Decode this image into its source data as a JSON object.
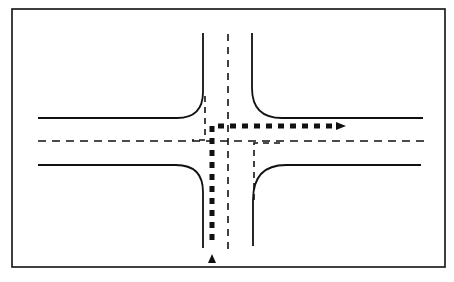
{
  "diagram": {
    "title": "Intersection turning path diagram",
    "colors": {
      "background": "#ffffff",
      "ink": "#111111"
    },
    "elements": {
      "frame": "outer-border",
      "curbs": [
        "northwest-curb",
        "northeast-curb",
        "southwest-curb",
        "southeast-curb"
      ],
      "centerlines": [
        "north-south-centerline",
        "east-west-centerline"
      ],
      "lane_markings": [
        "stop-line-north-approach",
        "stop-line-east-approach"
      ],
      "path": {
        "name": "right-turn-path",
        "from": "south",
        "to": "east",
        "start_marker": "arrow-up-triangle",
        "end_marker": "arrow-right-triangle"
      }
    }
  }
}
